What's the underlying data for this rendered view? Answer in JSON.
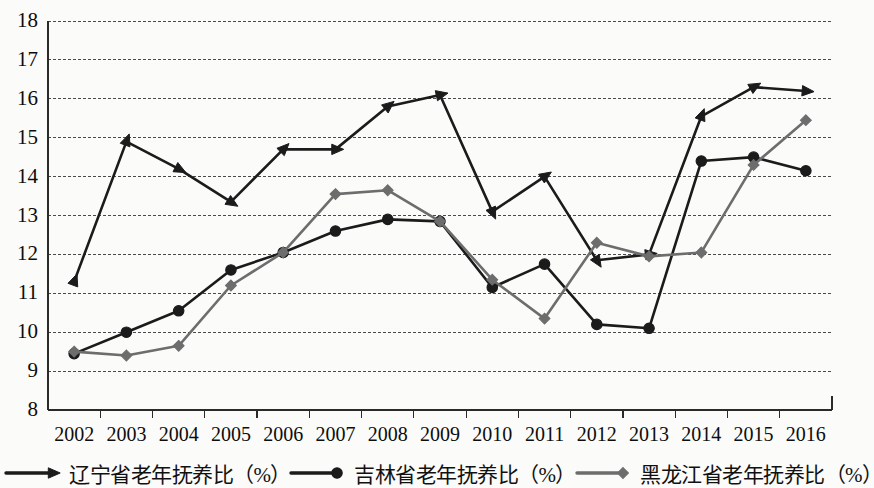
{
  "chart_data": {
    "type": "line",
    "title": "",
    "xlabel": "",
    "ylabel": "",
    "grid": true,
    "legend_position": "bottom",
    "ylim": [
      8,
      18
    ],
    "ytick_labels": [
      "18",
      "17",
      "16",
      "15",
      "14",
      "13",
      "12",
      "11",
      "10",
      "9",
      "8"
    ],
    "categories": [
      "2002",
      "2003",
      "2004",
      "2005",
      "2006",
      "2007",
      "2008",
      "2009",
      "2010",
      "2011",
      "2012",
      "2013",
      "2014",
      "2015",
      "2016"
    ],
    "series": [
      {
        "name": "辽宁省老年抚养比（%）",
        "marker": "triangle-arrow",
        "color": "#1b1b1b",
        "values": [
          11.3,
          14.9,
          14.2,
          13.35,
          14.7,
          14.7,
          15.8,
          16.1,
          13.1,
          14.0,
          11.85,
          12.0,
          15.55,
          16.3,
          16.2
        ]
      },
      {
        "name": "吉林省老年抚养比（%）",
        "marker": "circle",
        "color": "#1b1b1b",
        "values": [
          9.45,
          10.0,
          10.55,
          11.6,
          12.05,
          12.6,
          12.9,
          12.85,
          11.15,
          11.75,
          10.2,
          10.1,
          14.4,
          14.5,
          14.15
        ]
      },
      {
        "name": "黑龙江省老年抚养比（%）",
        "marker": "diamond",
        "color": "#6d6d6d",
        "values": [
          9.5,
          9.4,
          9.65,
          11.2,
          12.05,
          13.55,
          13.65,
          12.85,
          11.35,
          10.35,
          12.3,
          11.95,
          12.05,
          14.3,
          15.45
        ]
      }
    ]
  },
  "legend": {
    "items": [
      {
        "label": "辽宁省老年抚养比（%）",
        "marker": "triangle-arrow",
        "color": "#1b1b1b"
      },
      {
        "label": "吉林省老年抚养比（%）",
        "marker": "circle",
        "color": "#1b1b1b"
      },
      {
        "label": "黑龙江省老年抚养比（%）",
        "marker": "diamond",
        "color": "#6d6d6d"
      }
    ]
  }
}
